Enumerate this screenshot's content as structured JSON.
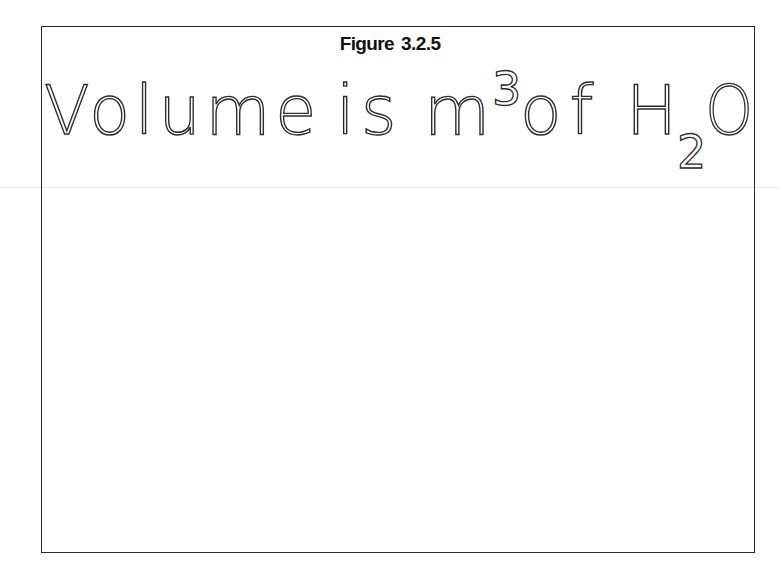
{
  "figure": {
    "label": "Figure",
    "number": "3.2.5"
  },
  "heading": {
    "word_volume": "Volume",
    "word_is": "is",
    "unit_base": "m",
    "unit_superscript": "3",
    "word_of": "of",
    "formula_h": "H",
    "formula_subscript": "2",
    "formula_o": "O"
  },
  "colors": {
    "frame": "#2a2a2a",
    "text": "#2c2c2c",
    "background": "#ffffff"
  }
}
